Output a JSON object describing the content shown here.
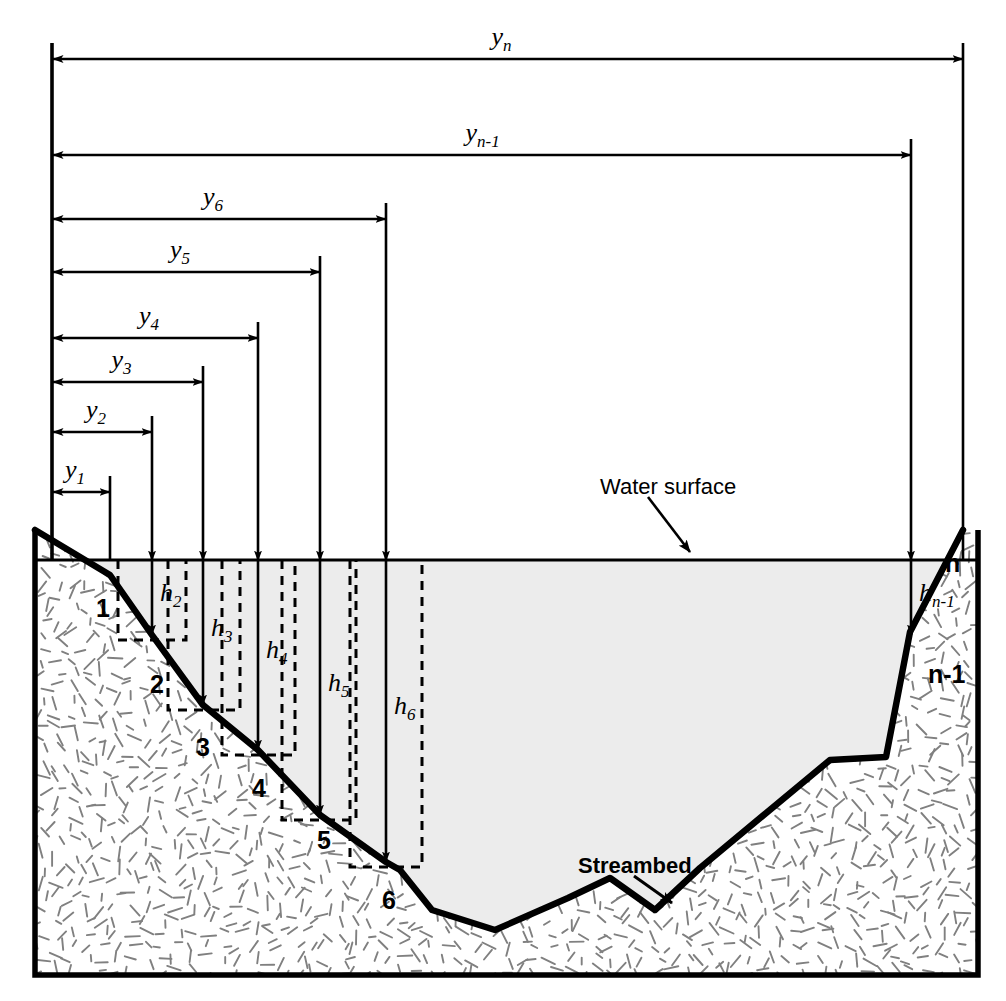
{
  "figure": {
    "type": "engineering-cross-section-diagram",
    "colors": {
      "outline": "#000000",
      "water_fill": "#eeeeee",
      "ground_fill": "#ffffff",
      "texture": "#777777",
      "background": "#ffffff"
    }
  },
  "annotations": {
    "water_surface": "Water surface",
    "streambed": "Streambed"
  },
  "width_dimensions": [
    {
      "id": "y1",
      "base": "y",
      "sub": "1",
      "x_end": 110,
      "row_y": 492
    },
    {
      "id": "y2",
      "base": "y",
      "sub": "2",
      "x_end": 152,
      "row_y": 432
    },
    {
      "id": "y3",
      "base": "y",
      "sub": "3",
      "x_end": 203,
      "row_y": 382
    },
    {
      "id": "y4",
      "base": "y",
      "sub": "4",
      "x_end": 258,
      "row_y": 338
    },
    {
      "id": "y5",
      "base": "y",
      "sub": "5",
      "x_end": 320,
      "row_y": 272
    },
    {
      "id": "y6",
      "base": "y",
      "sub": "6",
      "x_end": 386,
      "row_y": 219
    },
    {
      "id": "yn-1",
      "base": "y",
      "sub": "n-1",
      "x_end": 911,
      "row_y": 155
    },
    {
      "id": "yn",
      "base": "y",
      "sub": "n",
      "x_end": 963,
      "row_y": 59
    }
  ],
  "depth_dimensions": [
    {
      "id": "h2",
      "base": "h",
      "sub": "2",
      "x": 152,
      "y_top": 560,
      "y_bottom": 635
    },
    {
      "id": "h3",
      "base": "h",
      "sub": "3",
      "x": 203,
      "y_top": 560,
      "y_bottom": 705
    },
    {
      "id": "h4",
      "base": "h",
      "sub": "4",
      "x": 258,
      "y_top": 560,
      "y_bottom": 750
    },
    {
      "id": "h5",
      "base": "h",
      "sub": "5",
      "x": 320,
      "y_top": 560,
      "y_bottom": 815
    },
    {
      "id": "h6",
      "base": "h",
      "sub": "6",
      "x": 386,
      "y_top": 560,
      "y_bottom": 862
    },
    {
      "id": "hn-1",
      "base": "h",
      "sub": "n-1",
      "x": 911,
      "y_top": 560,
      "y_bottom": 635
    }
  ],
  "stations": [
    {
      "label": "1",
      "x": 96,
      "y": 596
    },
    {
      "label": "2",
      "x": 150,
      "y": 672
    },
    {
      "label": "3",
      "x": 196,
      "y": 735
    },
    {
      "label": "4",
      "x": 252,
      "y": 776
    },
    {
      "label": "5",
      "x": 317,
      "y": 828
    },
    {
      "label": "6",
      "x": 382,
      "y": 888
    },
    {
      "label": "n-1",
      "x": 928,
      "y": 662
    },
    {
      "label": "n",
      "x": 945,
      "y": 551
    }
  ],
  "geometry": {
    "frame": {
      "left": 35,
      "right": 978,
      "bottom": 975
    },
    "water_surface_y": 560,
    "bank_top_left_y": 530,
    "streambed_profile": "35,530 110,575 152,635 203,705 258,750 320,815 386,862 400,870 432,910 495,930 568,898 610,878 655,910 700,868 830,760 886,757 910,632 963,530",
    "water_polygon": "110,560 978,560 978,975 35,975 35,560"
  }
}
